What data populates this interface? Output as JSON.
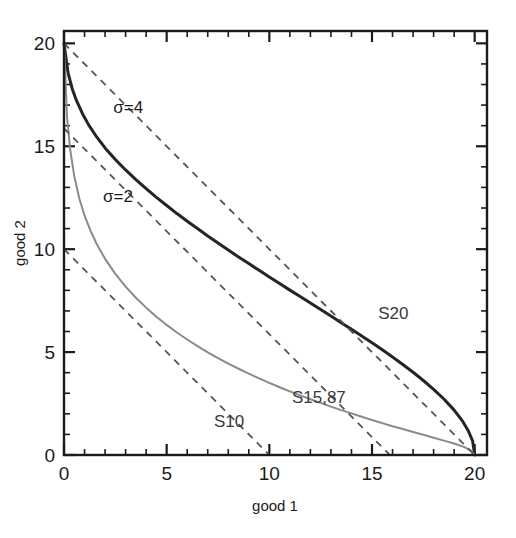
{
  "chart_data": {
    "type": "line",
    "title": "",
    "xlabel": "good 1",
    "ylabel": "good 2",
    "xlim": [
      0,
      20.6
    ],
    "ylim": [
      0,
      20.6
    ],
    "x_ticks": [
      0,
      5,
      10,
      15,
      20
    ],
    "y_ticks": [
      0,
      5,
      10,
      15,
      20
    ],
    "x_tick_labels": [
      "0",
      "5",
      "10",
      "15",
      "20"
    ],
    "y_tick_labels": [
      "0",
      "5",
      "10",
      "15",
      "20"
    ],
    "x_minor_step": 1,
    "y_minor_step": 1,
    "grid": false,
    "legend": "inline-annotations",
    "series": [
      {
        "name": "sigma=4",
        "label": "σ=4",
        "kind": "isoquant",
        "style": "solid",
        "color": "#242424",
        "width": 3.0,
        "label_x": 2.4,
        "label_y": 16.6,
        "points": [
          [
            0.0,
            20.0
          ],
          [
            0.2,
            18.55
          ],
          [
            0.4,
            17.8
          ],
          [
            0.6,
            17.24
          ],
          [
            0.9,
            16.58
          ],
          [
            1.2,
            16.04
          ],
          [
            1.6,
            15.44
          ],
          [
            2.0,
            14.92
          ],
          [
            2.5,
            14.36
          ],
          [
            3.0,
            13.85
          ],
          [
            3.5,
            13.38
          ],
          [
            4.0,
            12.94
          ],
          [
            4.5,
            12.52
          ],
          [
            5.0,
            12.12
          ],
          [
            5.5,
            11.73
          ],
          [
            6.0,
            11.36
          ],
          [
            6.5,
            11.0
          ],
          [
            7.0,
            10.64
          ],
          [
            7.5,
            10.3
          ],
          [
            8.0,
            9.96
          ],
          [
            8.5,
            9.62
          ],
          [
            9.0,
            9.3
          ],
          [
            9.5,
            8.97
          ],
          [
            10.0,
            8.65
          ],
          [
            10.5,
            8.33
          ],
          [
            11.0,
            8.01
          ],
          [
            11.5,
            7.7
          ],
          [
            12.0,
            7.38
          ],
          [
            12.5,
            7.07
          ],
          [
            13.0,
            6.75
          ],
          [
            13.5,
            6.43
          ],
          [
            14.0,
            6.11
          ],
          [
            14.5,
            5.78
          ],
          [
            15.0,
            5.45
          ],
          [
            15.5,
            5.11
          ],
          [
            16.0,
            4.76
          ],
          [
            16.5,
            4.4
          ],
          [
            17.0,
            4.02
          ],
          [
            17.5,
            3.62
          ],
          [
            18.0,
            3.19
          ],
          [
            18.5,
            2.72
          ],
          [
            19.0,
            2.18
          ],
          [
            19.4,
            1.66
          ],
          [
            19.7,
            1.15
          ],
          [
            19.9,
            0.68
          ],
          [
            20.0,
            0.0
          ]
        ]
      },
      {
        "name": "sigma=2",
        "label": "σ=2",
        "kind": "isoquant",
        "style": "solid",
        "color": "#8a8a8a",
        "width": 2.0,
        "label_x": 1.9,
        "label_y": 12.3,
        "points": [
          [
            0.0,
            20.0
          ],
          [
            0.15,
            16.4
          ],
          [
            0.3,
            14.85
          ],
          [
            0.5,
            13.55
          ],
          [
            0.75,
            12.45
          ],
          [
            1.0,
            11.64
          ],
          [
            1.3,
            10.88
          ],
          [
            1.6,
            10.24
          ],
          [
            2.0,
            9.53
          ],
          [
            2.5,
            8.8
          ],
          [
            3.0,
            8.18
          ],
          [
            3.5,
            7.64
          ],
          [
            4.0,
            7.16
          ],
          [
            4.5,
            6.72
          ],
          [
            5.0,
            6.32
          ],
          [
            5.5,
            5.95
          ],
          [
            6.0,
            5.61
          ],
          [
            6.5,
            5.29
          ],
          [
            7.0,
            4.99
          ],
          [
            7.5,
            4.71
          ],
          [
            8.0,
            4.44
          ],
          [
            8.5,
            4.19
          ],
          [
            9.0,
            3.95
          ],
          [
            9.5,
            3.72
          ],
          [
            10.0,
            3.5
          ],
          [
            10.5,
            3.29
          ],
          [
            11.0,
            3.09
          ],
          [
            11.5,
            2.9
          ],
          [
            12.0,
            2.71
          ],
          [
            12.5,
            2.53
          ],
          [
            13.0,
            2.35
          ],
          [
            13.5,
            2.18
          ],
          [
            14.0,
            2.02
          ],
          [
            14.5,
            1.86
          ],
          [
            15.0,
            1.7
          ],
          [
            15.5,
            1.55
          ],
          [
            16.0,
            1.4
          ],
          [
            16.5,
            1.26
          ],
          [
            17.0,
            1.12
          ],
          [
            17.5,
            0.98
          ],
          [
            18.0,
            0.84
          ],
          [
            18.5,
            0.7
          ],
          [
            19.0,
            0.56
          ],
          [
            19.5,
            0.38
          ],
          [
            19.8,
            0.22
          ],
          [
            20.0,
            0.0
          ]
        ]
      }
    ],
    "budget_lines": [
      {
        "name": "S20",
        "label": "S20",
        "style": "dashed",
        "color": "#555555",
        "width": 1.8,
        "x0": 0.0,
        "y0": 20.0,
        "x1": 20.0,
        "y1": 0.0,
        "label_x": 15.3,
        "label_y": 6.6
      },
      {
        "name": "S15,87",
        "label": "S15,87",
        "style": "dashed",
        "color": "#555555",
        "width": 1.8,
        "x0": 0.0,
        "y0": 15.87,
        "x1": 15.87,
        "y1": 0.0,
        "label_x": 11.1,
        "label_y": 2.55
      },
      {
        "name": "S10",
        "label": "S10",
        "style": "dashed",
        "color": "#555555",
        "width": 1.8,
        "x0": 0.0,
        "y0": 10.0,
        "x1": 10.0,
        "y1": 0.0,
        "label_x": 7.3,
        "label_y": 1.35
      }
    ]
  }
}
